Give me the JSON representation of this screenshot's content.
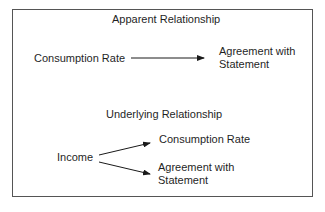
{
  "diagram": {
    "apparent": {
      "title": "Apparent Relationship",
      "source": "Consumption Rate",
      "target_line1": "Agreement with",
      "target_line2": "Statement"
    },
    "underlying": {
      "title": "Underlying Relationship",
      "source": "Income",
      "target_a": "Consumption Rate",
      "target_b_line1": "Agreement with",
      "target_b_line2": "Statement"
    },
    "colors": {
      "line": "#1a1a1a",
      "frame": "#555555",
      "background": "#ffffff"
    }
  }
}
